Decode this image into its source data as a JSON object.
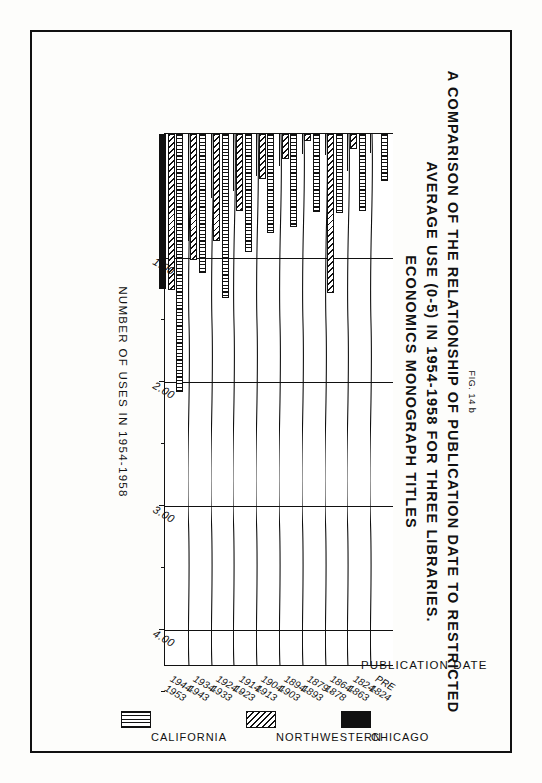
{
  "figure": {
    "number": "FIG. 14 b",
    "title_lines": [
      "A COMPARISON OF THE RELATIONSHIP OF PUBLICATION DATE TO RESTRICTED",
      "AVERAGE USE (0-5) IN 1954-1958 FOR THREE LIBRARIES.",
      "ECONOMICS MONOGRAPH TITLES"
    ]
  },
  "chart_data": {
    "type": "bar",
    "orientation": "horizontal",
    "title": "A COMPARISON OF THE RELATIONSHIP OF PUBLICATION DATE TO RESTRICTED AVERAGE USE (0-5) IN 1954-1958 FOR THREE LIBRARIES. ECONOMICS MONOGRAPH TITLES",
    "xlabel": "PUBLICATION DATE",
    "ylabel": "NUMBER OF USES IN 1954-1958",
    "ylim": [
      0,
      4.3
    ],
    "yticks": [
      1.0,
      2.0,
      3.0,
      4.0
    ],
    "ytick_labels": [
      "1.00",
      "2.00",
      "3.00",
      "4.00"
    ],
    "grid": true,
    "legend_position": "bottom",
    "categories": [
      "PRE 1824",
      "1824-1863",
      "1864-1878",
      "1879-1893",
      "1894-1903",
      "1904-1913",
      "1914-1923",
      "1924-1933",
      "1934-1943",
      "1944-1953"
    ],
    "category_labels": [
      {
        "top": "PRE",
        "bottom": "1824"
      },
      {
        "top": "1824-",
        "bottom": "1863"
      },
      {
        "top": "1864-",
        "bottom": "1878"
      },
      {
        "top": "1879 -",
        "bottom": "1893"
      },
      {
        "top": "1894-",
        "bottom": "1903"
      },
      {
        "top": "1904-",
        "bottom": "1913"
      },
      {
        "top": "1914-",
        "bottom": "1923"
      },
      {
        "top": "1924 -",
        "bottom": "1933"
      },
      {
        "top": "1934-",
        "bottom": "1943"
      },
      {
        "top": "1944-",
        "bottom": "1953"
      }
    ],
    "series": [
      {
        "name": "CALIFORNIA",
        "pattern": "stipple",
        "values": [
          0.38,
          0.62,
          0.64,
          0.63,
          0.75,
          0.8,
          0.95,
          1.32,
          1.12,
          2.08
        ]
      },
      {
        "name": "NORTHWESTERN",
        "pattern": "diagonal-hatch",
        "values": [
          0.0,
          0.12,
          1.28,
          0.06,
          0.2,
          0.36,
          0.62,
          0.86,
          1.02,
          1.26
        ]
      },
      {
        "name": "CHICAGO",
        "pattern": "solid-black",
        "values": [
          0.15,
          0.3,
          0.17,
          0.16,
          0.26,
          0.34,
          0.46,
          0.52,
          0.86,
          1.25
        ]
      }
    ],
    "legend": [
      {
        "label": "CHICAGO",
        "pattern": "solid-black"
      },
      {
        "label": "NORTHWESTERN",
        "pattern": "diagonal-hatch"
      },
      {
        "label": "CALIFORNIA",
        "pattern": "stipple"
      }
    ],
    "colors": {
      "ink": "#111111",
      "paper": "#ffffff"
    }
  }
}
